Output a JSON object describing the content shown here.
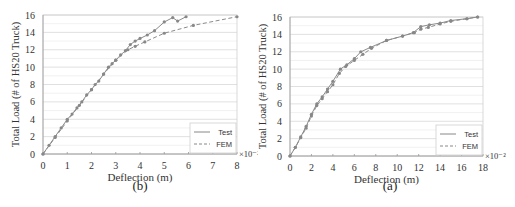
{
  "chart_data": [
    {
      "id": "b",
      "type": "line",
      "caption": "(b)",
      "xlabel": "Deflection (m)",
      "ylabel": "Total Load (# of HS20 Truck)",
      "x_multiplier": "×10⁻²",
      "xlim": [
        0,
        8
      ],
      "ylim": [
        0,
        16
      ],
      "xticks": [
        0,
        1,
        2,
        3,
        4,
        5,
        6,
        7,
        8
      ],
      "yticks": [
        0,
        2,
        4,
        6,
        8,
        10,
        12,
        14,
        16
      ],
      "grid": "horizontal",
      "legend_position": "lower right",
      "series": [
        {
          "name": "Test",
          "style": "solid",
          "x": [
            0,
            0.25,
            0.5,
            0.75,
            1.0,
            1.2,
            1.4,
            1.6,
            1.8,
            2.0,
            2.15,
            2.3,
            2.5,
            2.7,
            2.85,
            3.0,
            3.2,
            3.4,
            3.6,
            3.8,
            4.0,
            4.3,
            4.6,
            5.0,
            5.35,
            5.55,
            5.9
          ],
          "y": [
            0,
            1,
            2,
            3,
            4,
            4.6,
            5.3,
            6,
            6.8,
            7.4,
            8,
            8.4,
            9.2,
            10,
            10.4,
            10.8,
            11.4,
            11.9,
            12.6,
            13.0,
            13.3,
            13.7,
            14.2,
            15.2,
            15.7,
            15.3,
            15.8
          ]
        },
        {
          "name": "FEM",
          "style": "dashed",
          "x": [
            0,
            0.5,
            1.0,
            1.5,
            2.0,
            2.5,
            3.0,
            3.5,
            3.8,
            4.2,
            5.0,
            6.2,
            8.0
          ],
          "y": [
            0,
            1.9,
            3.8,
            5.6,
            7.4,
            9.2,
            10.8,
            12.0,
            12.4,
            12.9,
            13.9,
            14.8,
            15.8
          ]
        }
      ]
    },
    {
      "id": "a",
      "type": "line",
      "caption": "(a)",
      "xlabel": "Deflection (m)",
      "ylabel": "Total Load (# of HS20 Truck)",
      "x_multiplier": "×10⁻²",
      "xlim": [
        0,
        18
      ],
      "ylim": [
        0,
        16
      ],
      "xticks": [
        0,
        2,
        4,
        6,
        8,
        10,
        12,
        14,
        16,
        18
      ],
      "yticks": [
        0,
        2,
        4,
        6,
        8,
        10,
        12,
        14,
        16
      ],
      "grid": "horizontal",
      "legend_position": "lower right",
      "series": [
        {
          "name": "Test",
          "style": "solid",
          "x": [
            0,
            0.5,
            1.0,
            1.5,
            2.0,
            2.5,
            3.0,
            3.5,
            4.0,
            4.7,
            5.3,
            6.0,
            6.6,
            7.5,
            9.0,
            10.5,
            11.5,
            12.2,
            13.0,
            14.0,
            15.0,
            16.5,
            17.5
          ],
          "y": [
            0,
            1,
            2.2,
            3.4,
            4.8,
            6.0,
            6.8,
            7.7,
            8.6,
            10.0,
            10.5,
            11.2,
            12.0,
            12.5,
            13.3,
            13.8,
            14.2,
            14.9,
            15.1,
            15.3,
            15.6,
            15.8,
            16.0
          ]
        },
        {
          "name": "FEM",
          "style": "dashed",
          "x": [
            0,
            0.5,
            1.0,
            1.5,
            2.0,
            2.5,
            3.0,
            3.5,
            4.0,
            4.6,
            5.2,
            6.0,
            6.8,
            7.6,
            9.0,
            10.5,
            11.6,
            12.2,
            12.9,
            14.0,
            15.0,
            16.5,
            17.5
          ],
          "y": [
            0,
            1,
            2.1,
            3.2,
            4.6,
            5.8,
            6.6,
            7.4,
            8.2,
            9.5,
            10.3,
            11.0,
            11.7,
            12.4,
            13.3,
            13.8,
            14.2,
            14.6,
            14.8,
            15.2,
            15.5,
            15.8,
            16.0
          ]
        }
      ]
    }
  ]
}
